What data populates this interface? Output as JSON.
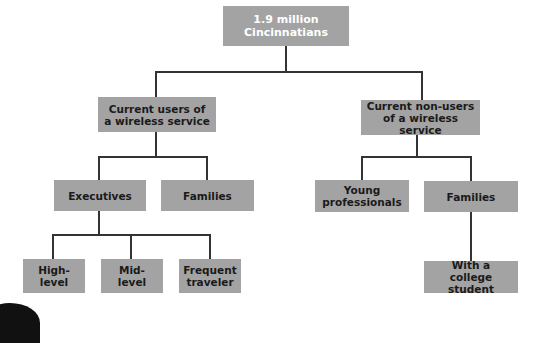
{
  "diagram": {
    "type": "tree",
    "root": {
      "label": "1.9 million\nCincinnatians"
    },
    "level1": [
      {
        "label": "Current users of\na wireless service"
      },
      {
        "label": "Current non-users\nof a wireless service"
      }
    ],
    "level2_users": [
      {
        "label": "Executives"
      },
      {
        "label": "Families"
      }
    ],
    "level2_nonusers": [
      {
        "label": "Young\nprofessionals"
      },
      {
        "label": "Families"
      }
    ],
    "level3_executives": [
      {
        "label": "High-\nlevel"
      },
      {
        "label": "Mid-\nlevel"
      },
      {
        "label": "Frequent\ntraveler"
      }
    ],
    "level3_families": [
      {
        "label": "With a\ncollege student"
      }
    ],
    "colors": {
      "box": "#a3a3a3",
      "line": "#333333",
      "root_text": "#ffffff",
      "text": "#1a1a1a"
    }
  }
}
